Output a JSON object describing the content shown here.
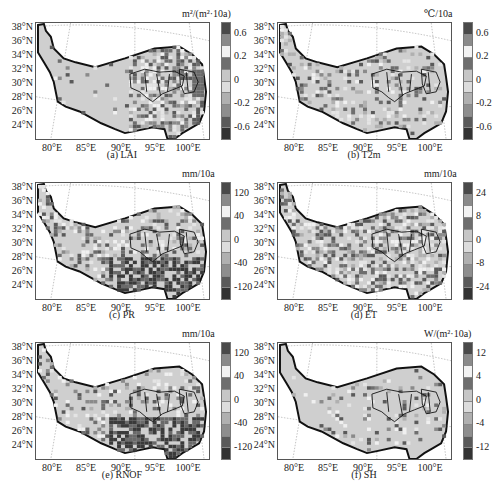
{
  "chart_data": [
    {
      "type": "heatmap",
      "id": "a",
      "title": "(a) LAI",
      "unit": "m²/(m²·10a)",
      "xlabel": "",
      "ylabel": "",
      "x_ticks": [
        "80°E",
        "85°E",
        "90°E",
        "95°E",
        "100°E"
      ],
      "y_ticks": [
        "38°N",
        "36°N",
        "34°N",
        "32°N",
        "30°N",
        "28°N",
        "26°N",
        "24°N"
      ],
      "xlim": [
        77.5,
        104
      ],
      "ylim": [
        23.8,
        39.2
      ],
      "colorbar_labels": [
        "0.6",
        "0.2",
        "0",
        "-0.2",
        "-0.6"
      ],
      "colorbar_levels": 10,
      "grid": "dotted lat/lon graticule",
      "description": "Mostly near-zero (light gray) over western plateau; positive/negative trends concentrated in southeast and east (strong positive at eastern edge ~100-103°E, 30-34°N)"
    },
    {
      "type": "heatmap",
      "id": "b",
      "title": "(b) T2m",
      "unit": "℃/10a",
      "x_ticks": [
        "80°E",
        "85°E",
        "90°E",
        "95°E",
        "100°E"
      ],
      "y_ticks": [
        "38°N",
        "36°N",
        "34°N",
        "32°N",
        "30°N",
        "28°N",
        "26°N",
        "24°N"
      ],
      "xlim": [
        77.5,
        104
      ],
      "ylim": [
        23.8,
        39.2
      ],
      "colorbar_labels": [
        "0.6",
        "0.2",
        "0",
        "-0.2",
        "-0.6"
      ],
      "colorbar_levels": 10,
      "description": "Scattered weak trends across plateau; slightly darker patches in central and eastern regions"
    },
    {
      "type": "heatmap",
      "id": "c",
      "title": "(c) PR",
      "unit": "mm/10a",
      "x_ticks": [
        "80°E",
        "85°E",
        "90°E",
        "95°E",
        "100°E"
      ],
      "y_ticks": [
        "38°N",
        "36°N",
        "34°N",
        "32°N",
        "30°N",
        "28°N",
        "26°N",
        "24°N"
      ],
      "xlim": [
        77.5,
        104
      ],
      "ylim": [
        23.8,
        39.2
      ],
      "colorbar_labels": [
        "120",
        "40",
        "0",
        "-40",
        "-120"
      ],
      "colorbar_levels": 10,
      "description": "Scattered changes in interior; strong negative (dark) trends in southeast 24-30°N, 90-102°E"
    },
    {
      "type": "heatmap",
      "id": "d",
      "title": "(d) ET",
      "unit": "mm/10a",
      "x_ticks": [
        "80°E",
        "85°E",
        "90°E",
        "95°E",
        "100°E"
      ],
      "y_ticks": [
        "38°N",
        "36°N",
        "34°N",
        "32°N",
        "30°N",
        "28°N",
        "26°N",
        "24°N"
      ],
      "xlim": [
        77.5,
        104
      ],
      "ylim": [
        23.8,
        39.2
      ],
      "colorbar_labels": [
        "24",
        "8",
        "0",
        "-8",
        "-24"
      ],
      "colorbar_levels": 10,
      "description": "Widespread mixed trends across plateau; darker patches in central-east near source regions"
    },
    {
      "type": "heatmap",
      "id": "e",
      "title": "(e) RNOF",
      "unit": "mm/10a",
      "x_ticks": [
        "80°E",
        "85°E",
        "90°E",
        "95°E",
        "100°E"
      ],
      "y_ticks": [
        "38°N",
        "36°N",
        "34°N",
        "32°N",
        "30°N",
        "28°N",
        "26°N",
        "24°N"
      ],
      "xlim": [
        77.5,
        104
      ],
      "ylim": [
        23.8,
        39.2
      ],
      "colorbar_labels": [
        "120",
        "40",
        "0",
        "-40",
        "-120"
      ],
      "colorbar_levels": 10,
      "description": "Mostly near-zero; strong negative trends in southeast 24-30°N"
    },
    {
      "type": "heatmap",
      "id": "f",
      "title": "(f) SH",
      "unit": "W/(m²·10a)",
      "x_ticks": [
        "80°E",
        "85°E",
        "90°E",
        "95°E",
        "100°E"
      ],
      "y_ticks": [
        "38°N",
        "36°N",
        "34°N",
        "32°N",
        "30°N",
        "28°N",
        "26°N",
        "24°N"
      ],
      "xlim": [
        77.5,
        104
      ],
      "ylim": [
        23.8,
        39.2
      ],
      "colorbar_labels": [
        "12",
        "4",
        "0",
        "-4",
        "-12"
      ],
      "colorbar_levels": 10,
      "description": "Mostly near-zero with sparse weak changes in central plateau"
    }
  ],
  "colorbar_colors": [
    "#4a4a4a",
    "#8a8a8a",
    "#f2f2f2",
    "#6e6e6e",
    "#c6c6c6",
    "#dcdcdc",
    "#b0b0b0",
    "#8e8e8e",
    "#5a5a5a",
    "#333333"
  ],
  "panels": [
    {
      "caption": "(a) LAI",
      "unit": "m²/(m²·10a)",
      "cb": [
        "0.6",
        "0.2",
        "0",
        "-0.2",
        "-0.6"
      ]
    },
    {
      "caption": "(b) T2m",
      "unit": "℃/10a",
      "cb": [
        "0.6",
        "0.2",
        "0",
        "-0.2",
        "-0.6"
      ]
    },
    {
      "caption": "(c) PR",
      "unit": "mm/10a",
      "cb": [
        "120",
        "40",
        "0",
        "-40",
        "-120"
      ]
    },
    {
      "caption": "(d) ET",
      "unit": "mm/10a",
      "cb": [
        "24",
        "8",
        "0",
        "-8",
        "-24"
      ]
    },
    {
      "caption": "(e) RNOF",
      "unit": "mm/10a",
      "cb": [
        "120",
        "40",
        "0",
        "-40",
        "-120"
      ]
    },
    {
      "caption": "(f) SH",
      "unit": "W/(m²·10a)",
      "cb": [
        "12",
        "4",
        "0",
        "-4",
        "-12"
      ]
    }
  ],
  "axes": {
    "y": [
      "38°N",
      "36°N",
      "34°N",
      "32°N",
      "30°N",
      "28°N",
      "26°N",
      "24°N"
    ],
    "x": [
      "80°E",
      "85°E",
      "90°E",
      "95°E",
      "100°E"
    ]
  }
}
